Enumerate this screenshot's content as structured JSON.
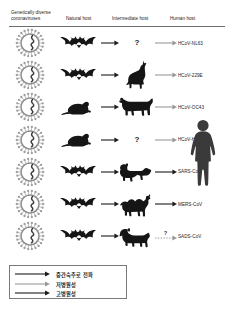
{
  "figure": {
    "columns": [
      {
        "id": "genetically-diverse-coronaviruses",
        "label": "Genetically diverse\ncoronaviruses"
      },
      {
        "id": "natural-host",
        "label": "Natural host"
      },
      {
        "id": "intermediate-host",
        "label": "Intermediate host"
      },
      {
        "id": "human-host",
        "label": "Human host"
      }
    ],
    "rows": [
      {
        "virus": "HCoV-NL63",
        "natural_host": "bat",
        "natural_host_icon": "bat-icon",
        "intermediate_host": "unknown",
        "intermediate_host_icon": "question-mark-icon",
        "arrow_style": "low",
        "human_infection": true
      },
      {
        "virus": "HCoV-229E",
        "natural_host": "bat",
        "natural_host_icon": "bat-icon",
        "intermediate_host": "alpaca",
        "intermediate_host_icon": "alpaca-icon",
        "arrow_style": "low",
        "human_infection": true
      },
      {
        "virus": "HCoV-OC43",
        "natural_host": "rodent",
        "natural_host_icon": "mouse-icon",
        "intermediate_host": "cattle",
        "intermediate_host_icon": "cow-icon",
        "arrow_style": "low",
        "human_infection": true
      },
      {
        "virus": "HCoV-HKU1",
        "natural_host": "rodent",
        "natural_host_icon": "mouse-icon",
        "intermediate_host": "unknown",
        "intermediate_host_icon": "question-mark-icon",
        "arrow_style": "low",
        "human_infection": true
      },
      {
        "virus": "SARS-CoV",
        "natural_host": "bat",
        "natural_host_icon": "bat-icon",
        "intermediate_host": "civet",
        "intermediate_host_icon": "civet-icon",
        "arrow_style": "high",
        "human_infection": true
      },
      {
        "virus": "MERS-CoV",
        "natural_host": "bat",
        "natural_host_icon": "bat-icon",
        "intermediate_host": "camel",
        "intermediate_host_icon": "camel-icon",
        "arrow_style": "high",
        "human_infection": true
      },
      {
        "virus": "SADS-CoV",
        "natural_host": "bat",
        "natural_host_icon": "bat-icon",
        "intermediate_host": "pig",
        "intermediate_host_icon": "pig-icon",
        "arrow_style": "unknown",
        "human_infection": false,
        "human_arrow_marker": "?"
      }
    ],
    "human_figure": {
      "icon": "human-silhouette-icon"
    },
    "legend": {
      "items": [
        {
          "id": "transmission-to-intermediate-host",
          "label": "중간숙주로 전파",
          "line": "solid",
          "color": "#1c1c1c"
        },
        {
          "id": "low-pathogenicity",
          "label": "저병원성",
          "line": "solid",
          "color": "#9a9a9a"
        },
        {
          "id": "high-pathogenicity",
          "label": "고병원성",
          "line": "solid",
          "color": "#1c1c1c"
        }
      ]
    },
    "colors": {
      "low_pathogenicity_arrow": "#9a9a9a",
      "high_pathogenicity_arrow": "#1c1c1c",
      "unknown_arrow": "#9a9a9a",
      "virion": "#8e8e8e",
      "animal": "#151515",
      "human": "#3a3a3a",
      "rule": "#6f6f6f"
    }
  }
}
